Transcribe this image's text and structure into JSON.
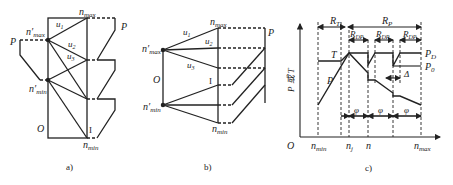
{
  "figure_a": {
    "caption": "a)",
    "labels": {
      "n_max": "n",
      "n_max_sub": "max",
      "n_max_prime": "n′",
      "n_max_prime_sub": "max",
      "n_min_prime": "n′",
      "n_min_prime_sub": "min",
      "n_min": "n",
      "n_min_sub": "min",
      "u1": "u",
      "u1_sub": "1",
      "u2": "u",
      "u2_sub": "2",
      "u3": "u",
      "u3_sub": "3",
      "P_left": "P",
      "P_right": "P",
      "origin": "O",
      "roman_I": "I"
    }
  },
  "figure_b": {
    "caption": "b)",
    "labels": {
      "n_max": "n",
      "n_max_sub": "max",
      "n_max_prime": "n′",
      "n_max_prime_sub": "max",
      "n_min_prime": "n′",
      "n_min_prime_sub": "min",
      "n_min": "n",
      "n_min_sub": "min",
      "u1": "u",
      "u1_sub": "1",
      "u2": "u",
      "u2_sub": "2",
      "u3": "u",
      "u3_sub": "3",
      "P": "P",
      "origin": "O",
      "roman_I": "I"
    }
  },
  "figure_c": {
    "caption": "c)",
    "labels": {
      "y_axis": "P 或 T",
      "origin": "O",
      "R_T": "R",
      "R_T_sub": "T",
      "R_P": "R",
      "R_P_sub": "P",
      "R_DP": "R",
      "R_DP_sub": "DP",
      "T": "T",
      "P": "P",
      "P_D": "P",
      "P_D_sub": "D",
      "P_0": "P",
      "P_0_sub": "0",
      "delta": "Δ",
      "phi": "φ",
      "x_n_min": "n",
      "x_n_min_sub": "min",
      "x_n_j": "n",
      "x_n_j_sub": "j",
      "x_n": "n",
      "x_n_max": "n",
      "x_n_max_sub": "max"
    }
  }
}
